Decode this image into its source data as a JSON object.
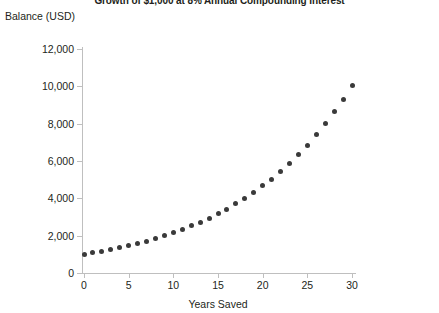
{
  "chart_data": {
    "type": "scatter",
    "title": "Growth of $1,000 at 8% Annual Compounding Interest",
    "xlabel": "Years Saved",
    "ylabel": "Balance (USD)",
    "xlim": [
      0,
      30
    ],
    "ylim": [
      0,
      12000
    ],
    "grid": false,
    "legend": null,
    "marker_color": "#3a3a3a",
    "axis_color": "#bfbfbf",
    "x_ticks": [
      0,
      5,
      10,
      15,
      20,
      25,
      30
    ],
    "x_tick_labels": [
      "0",
      "5",
      "10",
      "15",
      "20",
      "25",
      "30"
    ],
    "y_ticks": [
      0,
      2000,
      4000,
      6000,
      8000,
      10000,
      12000
    ],
    "y_tick_labels": [
      "0",
      "2,000",
      "4,000",
      "6,000",
      "8,000",
      "10,000",
      "12,000"
    ],
    "series": [
      {
        "name": "Balance",
        "x": [
          0,
          1,
          2,
          3,
          4,
          5,
          6,
          7,
          8,
          9,
          10,
          11,
          12,
          13,
          14,
          15,
          16,
          17,
          18,
          19,
          20,
          21,
          22,
          23,
          24,
          25,
          26,
          27,
          28,
          29,
          30
        ],
        "values": [
          1000,
          1080,
          1166,
          1260,
          1360,
          1469,
          1587,
          1714,
          1851,
          1999,
          2159,
          2332,
          2518,
          2720,
          2937,
          3172,
          3426,
          3700,
          3996,
          4316,
          4661,
          5034,
          5437,
          5871,
          6341,
          6848,
          7396,
          7988,
          8627,
          9317,
          10063
        ]
      }
    ]
  }
}
